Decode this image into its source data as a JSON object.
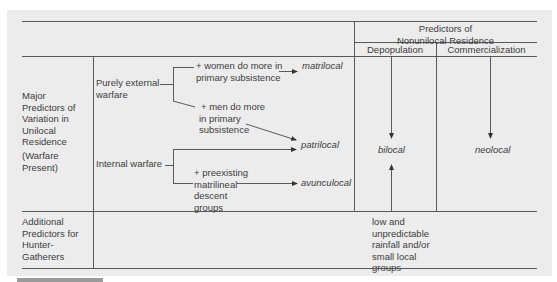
{
  "header": {
    "group_title": "Predictors of\nNonunilocal Residence",
    "group_title_line1": "Predictors of",
    "group_title_line2": "Nonunilocal Residence",
    "col_depopulation": "Depopulation",
    "col_commercialization": "Commercialization"
  },
  "rows": [
    {
      "label_lines": [
        "Major",
        "Predictors of",
        "Variation in",
        "Unilocal",
        "Residence"
      ],
      "sub_label_lines": [
        "(Warfare",
        "Present)"
      ]
    },
    {
      "label_lines": [
        "Additional",
        "Predictors for",
        "Hunter-",
        "Gatherers"
      ]
    }
  ],
  "predictors": {
    "external_warfare": [
      "Purely external",
      "warfare"
    ],
    "internal_warfare": "Internal warfare",
    "women_condition": [
      "+ women do more in",
      "primary subsistence"
    ],
    "men_condition": [
      "+ men do more",
      "in primary",
      "subsistence"
    ],
    "matrilineal_condition": [
      "+ preexisting",
      "matrilineal",
      "descent",
      "groups"
    ],
    "hunter_gatherer_condition": [
      "low and",
      "unpredictable",
      "rainfall and/or",
      "small local",
      "groups"
    ]
  },
  "outcomes": {
    "matrilocal": "matrilocal",
    "patrilocal": "patrilocal",
    "avunculocal": "avunculocal",
    "bilocal": "bilocal",
    "neolocal": "neolocal"
  },
  "colors": {
    "background": "#ececec",
    "line": "#555555",
    "text": "#3c3c3c"
  }
}
